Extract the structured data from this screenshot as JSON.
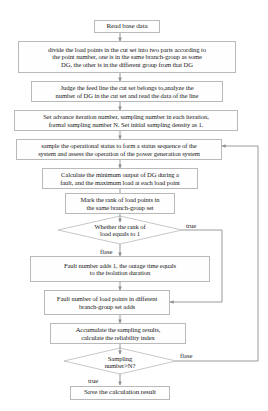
{
  "diagram": {
    "type": "flowchart",
    "orientation": "top-to-bottom",
    "nodes": [
      {
        "id": "n1",
        "shape": "process",
        "text": "Read base data"
      },
      {
        "id": "n2",
        "shape": "process",
        "text": "divide the load points in the cut set into two parts according to\nthe point number, one is in the same branch-group as some\nDG, the other is in the different group from that DG"
      },
      {
        "id": "n3",
        "shape": "process",
        "text": "Judge the feed line the cut set belongs to,analyze the\nnumber of DG in the cut set and read the data of the line"
      },
      {
        "id": "n4",
        "shape": "process",
        "text": "Set advance iteration number, sampling number in each iteration,\nformal sampling number N. Set initial sampling density as 1."
      },
      {
        "id": "n5",
        "shape": "process",
        "text": "sample the operational status to form a status sequence of the\nsystem and assess the operation of the power generation system"
      },
      {
        "id": "n6",
        "shape": "process",
        "text": "Calculate the minimum output of DG during a\nfault, and the maximum load at each load point"
      },
      {
        "id": "n7",
        "shape": "process",
        "text": "Mark the rank of load points in\nthe same branch-group set"
      },
      {
        "id": "n8",
        "shape": "decision",
        "text": "Whether the rank of\nload equals to 1"
      },
      {
        "id": "n9",
        "shape": "process",
        "text": "Fault number adds 1, the outage time equals\nto  the isolation duration"
      },
      {
        "id": "n10",
        "shape": "process",
        "text": "Fault number of load points in different\nbranch-group set adds"
      },
      {
        "id": "n11",
        "shape": "process",
        "text": "Accumulate the sampling results,\ncalculate the reliability index"
      },
      {
        "id": "n12",
        "shape": "decision",
        "text": "Sampling\nnumber>N?"
      },
      {
        "id": "n13",
        "shape": "process",
        "text": "Save the calculation result"
      }
    ],
    "edge_labels": {
      "rank_true": "true",
      "rank_false": "flase",
      "sampling_false": "flase",
      "sampling_true": "true"
    },
    "colors": {
      "box_border": "#b9b9b9",
      "line": "#9a9a9a",
      "text": "#1b1b1b",
      "background": "#ffffff"
    }
  }
}
